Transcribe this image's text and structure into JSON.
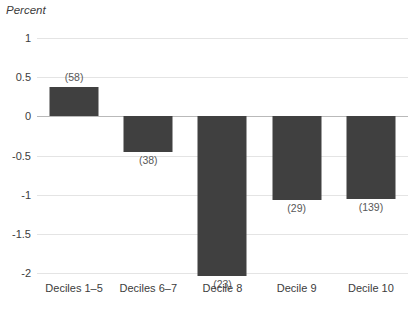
{
  "chart_data": {
    "type": "bar",
    "title": "",
    "subtitle": "",
    "xlabel": "",
    "ylabel": "Percent",
    "ylim": [
      -2,
      1
    ],
    "yticks": [
      1,
      0.5,
      0,
      -0.5,
      -1,
      -1.5,
      -2
    ],
    "ytick_labels": [
      "1",
      "0.5",
      "0",
      "-0.5",
      "-1",
      "-1.5",
      "-2"
    ],
    "grid": true,
    "legend": false,
    "categories": [
      "Deciles 1–5",
      "Deciles 6–7",
      "Decile 8",
      "Decile 9",
      "Decile 10"
    ],
    "values": [
      0.37,
      -0.46,
      -2.04,
      -1.07,
      -1.06
    ],
    "point_labels": [
      "(58)",
      "(38)",
      "(23)",
      "(29)",
      "(139)"
    ],
    "bar_color": "#404040",
    "grid_color": "#e4e4e4",
    "zero_line_color": "#b9b9b9",
    "text_color": "#3c3c3c"
  }
}
